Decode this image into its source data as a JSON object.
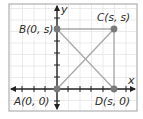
{
  "figure": {
    "frame": {
      "x": 9,
      "y": 4,
      "width": 128,
      "height": 107
    },
    "grid": {
      "spacing": 11.5,
      "color": "#e6e6e6"
    },
    "axes": {
      "origin": {
        "x": 57,
        "y": 89
      },
      "x_label": "x",
      "y_label": "y",
      "color": "#222222",
      "x_ticks": [
        22,
        34,
        45,
        68,
        80,
        91,
        103,
        126
      ],
      "y_ticks": [
        18,
        41,
        53,
        65,
        77,
        101
      ]
    },
    "points": [
      {
        "id": "A",
        "label": "A(0, 0)",
        "x": 57,
        "y": 89,
        "label_x": 14,
        "label_y": 105
      },
      {
        "id": "B",
        "label": "B(0, s)",
        "x": 57,
        "y": 29,
        "label_x": 19,
        "label_y": 33
      },
      {
        "id": "C",
        "label": "C(s, s)",
        "x": 114,
        "y": 29,
        "label_x": 97,
        "label_y": 21
      },
      {
        "id": "D",
        "label": "D(s, 0)",
        "x": 114,
        "y": 89,
        "label_x": 95,
        "label_y": 105
      }
    ],
    "segments": [
      {
        "from": "B",
        "to": "C"
      },
      {
        "from": "C",
        "to": "D"
      },
      {
        "from": "A",
        "to": "C"
      },
      {
        "from": "B",
        "to": "D"
      }
    ],
    "colors": {
      "point": "#7a7a7a",
      "segment": "#a8a8a8",
      "frame": "#b0b0b0",
      "text": "#2a2a2a"
    }
  }
}
